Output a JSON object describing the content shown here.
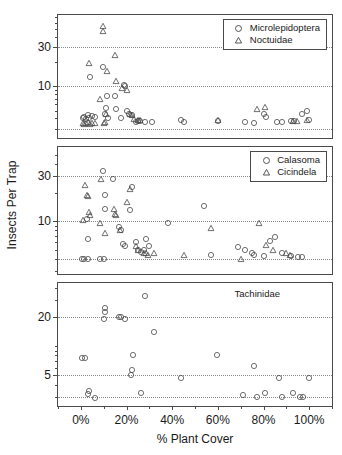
{
  "chart_data": {
    "type": "scatter",
    "title": "",
    "xlabel": "% Plant Cover",
    "ylabel": "Insects Per Trap",
    "grid": true,
    "yscale": "log",
    "xlim": [
      -10,
      110
    ],
    "xticks": [
      0,
      20,
      40,
      60,
      80,
      100
    ],
    "xticklabels": [
      "0%",
      "20%",
      "40%",
      "60%",
      "80%",
      "100%"
    ],
    "panels": [
      {
        "id": "panel-1",
        "name": "microlepidoptera-noctuidae-panel",
        "ylim": [
          2.3,
          75
        ],
        "yticks": [
          10,
          30
        ],
        "yticklabels": [
          "10",
          "30"
        ],
        "gridvalues": [
          3,
          10,
          30
        ],
        "legend_position": "top-right",
        "series": [
          {
            "name": "Microlepidoptera",
            "marker": "circle",
            "points": [
              [
                1.0,
                4.0
              ],
              [
                1.5,
                4.2
              ],
              [
                2.2,
                3.9
              ],
              [
                3.0,
                4.4
              ],
              [
                3.6,
                4.1
              ],
              [
                4.2,
                13.0
              ],
              [
                5.0,
                4.3
              ],
              [
                6.0,
                4.2
              ],
              [
                9.5,
                17.0
              ],
              [
                10.5,
                4.5
              ],
              [
                11.0,
                5.4
              ],
              [
                11.5,
                7.5
              ],
              [
                12.0,
                4.0
              ],
              [
                15.0,
                7.5
              ],
              [
                15.5,
                5.3
              ],
              [
                17.5,
                4.0
              ],
              [
                19.0,
                10.2
              ],
              [
                19.5,
                10.0
              ],
              [
                20.0,
                5.0
              ],
              [
                21.0,
                4.6
              ],
              [
                22.5,
                4.4
              ],
              [
                24.0,
                3.6
              ],
              [
                25.0,
                3.7
              ],
              [
                26.0,
                3.7
              ],
              [
                28.0,
                3.6
              ],
              [
                31.0,
                3.6
              ],
              [
                44.0,
                3.8
              ],
              [
                45.0,
                3.6
              ],
              [
                60.0,
                3.7
              ],
              [
                72.0,
                3.6
              ],
              [
                76.0,
                3.5
              ],
              [
                80.0,
                4.5
              ],
              [
                81.0,
                4.2
              ],
              [
                86.0,
                3.6
              ],
              [
                88.0,
                3.6
              ],
              [
                92.0,
                3.7
              ],
              [
                93.5,
                3.7
              ],
              [
                97.0,
                4.6
              ],
              [
                99.0,
                5.0
              ],
              [
                100.0,
                3.8
              ]
            ]
          },
          {
            "name": "Noctuidae",
            "marker": "triangle",
            "points": [
              [
                1.0,
                3.5
              ],
              [
                1.6,
                3.4
              ],
              [
                2.4,
                3.5
              ],
              [
                3.2,
                3.6
              ],
              [
                4.0,
                3.4
              ],
              [
                3.5,
                19.0
              ],
              [
                5.0,
                3.5
              ],
              [
                6.0,
                3.5
              ],
              [
                8.5,
                7.0
              ],
              [
                10.0,
                3.5
              ],
              [
                10.5,
                3.6
              ],
              [
                11.0,
                4.6
              ],
              [
                9.5,
                55.0
              ],
              [
                9.8,
                48.0
              ],
              [
                11.5,
                15.5
              ],
              [
                15.0,
                24.0
              ],
              [
                15.5,
                11.5
              ],
              [
                18.0,
                9.5
              ],
              [
                20.0,
                9.0
              ],
              [
                21.5,
                4.5
              ],
              [
                22.5,
                4.4
              ],
              [
                23.5,
                3.9
              ],
              [
                25.0,
                3.8
              ],
              [
                26.0,
                3.8
              ],
              [
                60.0,
                3.8
              ],
              [
                77.0,
                5.2
              ],
              [
                80.5,
                5.5
              ],
              [
                93.0,
                3.7
              ],
              [
                94.5,
                3.7
              ],
              [
                99.0,
                3.8
              ]
            ]
          }
        ]
      },
      {
        "id": "panel-2",
        "name": "calasoma-cicindela-panel",
        "ylim": [
          2.8,
          60
        ],
        "yticks": [
          10,
          30
        ],
        "yticklabels": [
          "10",
          "30"
        ],
        "gridvalues": [
          4,
          10,
          30
        ],
        "legend_position": "top-right",
        "series": [
          {
            "name": "Calasoma",
            "marker": "circle",
            "points": [
              [
                0.5,
                4.0
              ],
              [
                1.5,
                4.0
              ],
              [
                3.0,
                4.0
              ],
              [
                2.5,
                10.5
              ],
              [
                3.0,
                6.5
              ],
              [
                8.5,
                4.0
              ],
              [
                10.0,
                4.0
              ],
              [
                9.5,
                34.0
              ],
              [
                10.5,
                19.0
              ],
              [
                10.8,
                13.5
              ],
              [
                14.0,
                28.0
              ],
              [
                16.5,
                8.8
              ],
              [
                17.5,
                8.0
              ],
              [
                18.5,
                5.8
              ],
              [
                19.5,
                5.5
              ],
              [
                21.5,
                13.0
              ],
              [
                22.5,
                23.0
              ],
              [
                24.0,
                6.0
              ],
              [
                25.0,
                5.0
              ],
              [
                26.5,
                4.8
              ],
              [
                27.5,
                5.0
              ],
              [
                28.5,
                6.5
              ],
              [
                30.0,
                5.5
              ],
              [
                38.0,
                9.5
              ],
              [
                54.0,
                14.5
              ],
              [
                57.0,
                4.4
              ],
              [
                69.0,
                5.4
              ],
              [
                72.0,
                5.0
              ],
              [
                75.0,
                4.6
              ],
              [
                76.0,
                4.4
              ],
              [
                80.0,
                4.3
              ],
              [
                83.0,
                6.2
              ],
              [
                85.0,
                6.8
              ],
              [
                88.0,
                4.6
              ],
              [
                92.0,
                4.3
              ],
              [
                95.0,
                4.2
              ],
              [
                97.0,
                4.2
              ]
            ]
          },
          {
            "name": "Cicindela",
            "marker": "triangle",
            "points": [
              [
                1.0,
                10.2
              ],
              [
                2.0,
                24.0
              ],
              [
                2.5,
                19.0
              ],
              [
                3.0,
                18.5
              ],
              [
                3.5,
                12.5
              ],
              [
                3.8,
                11.5
              ],
              [
                8.5,
                9.5
              ],
              [
                9.0,
                28.0
              ],
              [
                10.5,
                7.5
              ],
              [
                14.5,
                13.5
              ],
              [
                15.0,
                12.0
              ],
              [
                15.5,
                11.5
              ],
              [
                17.0,
                8.0
              ],
              [
                20.0,
                16.0
              ],
              [
                21.5,
                22.0
              ],
              [
                24.0,
                5.5
              ],
              [
                25.0,
                5.0
              ],
              [
                27.5,
                4.6
              ],
              [
                28.5,
                4.6
              ],
              [
                29.5,
                4.4
              ],
              [
                32.0,
                4.6
              ],
              [
                45.0,
                4.4
              ],
              [
                57.0,
                8.5
              ],
              [
                70.0,
                4.0
              ],
              [
                78.0,
                9.5
              ],
              [
                81.0,
                5.6
              ],
              [
                84.0,
                5.0
              ],
              [
                90.0,
                4.6
              ],
              [
                91.5,
                4.4
              ]
            ]
          }
        ]
      },
      {
        "id": "panel-3",
        "name": "tachinidae-panel",
        "ylim": [
          2.4,
          45
        ],
        "yticks": [
          5,
          20
        ],
        "yticklabels": [
          "5",
          "20"
        ],
        "gridvalues": [
          3,
          5,
          20
        ],
        "title": "Tachinidae",
        "series": [
          {
            "name": "Tachinidae",
            "marker": "circle",
            "points": [
              [
                0.5,
                7.5
              ],
              [
                2.0,
                7.5
              ],
              [
                3.0,
                3.2
              ],
              [
                3.5,
                3.4
              ],
              [
                6.0,
                2.9
              ],
              [
                10.0,
                19.0
              ],
              [
                10.5,
                25.0
              ],
              [
                10.8,
                22.5
              ],
              [
                16.5,
                20.0
              ],
              [
                17.5,
                19.8
              ],
              [
                19.5,
                19.0
              ],
              [
                22.0,
                5.0
              ],
              [
                22.5,
                5.6
              ],
              [
                22.8,
                8.0
              ],
              [
                26.5,
                3.3
              ],
              [
                28.0,
                33.0
              ],
              [
                32.0,
                14.0
              ],
              [
                44.0,
                4.7
              ],
              [
                59.5,
                8.0
              ],
              [
                71.0,
                3.1
              ],
              [
                76.0,
                6.3
              ],
              [
                77.0,
                3.0
              ],
              [
                80.5,
                3.3
              ],
              [
                87.0,
                4.7
              ],
              [
                88.0,
                3.0
              ],
              [
                93.0,
                3.3
              ],
              [
                96.0,
                3.0
              ],
              [
                97.5,
                3.0
              ],
              [
                100.0,
                4.7
              ]
            ]
          }
        ]
      }
    ],
    "legends": [
      {
        "panel": "panel-1",
        "entries": [
          {
            "label": "Microlepidoptera",
            "marker": "circle"
          },
          {
            "label": "Noctuidae",
            "marker": "triangle"
          }
        ]
      },
      {
        "panel": "panel-2",
        "entries": [
          {
            "label": "Calasoma",
            "marker": "circle"
          },
          {
            "label": "Cicindela",
            "marker": "triangle"
          }
        ]
      }
    ],
    "annotations": [
      {
        "panel": "panel-3",
        "text": "Tachinidae"
      }
    ]
  },
  "axes": {
    "ylabel": "Insects Per Trap",
    "xlabel": "% Plant Cover"
  },
  "colors": {
    "marker_stroke": "#444444",
    "axis": "#4a4a4a",
    "grid": "#8a8a8a",
    "background": "#ffffff",
    "text": "#1a1a1a"
  }
}
